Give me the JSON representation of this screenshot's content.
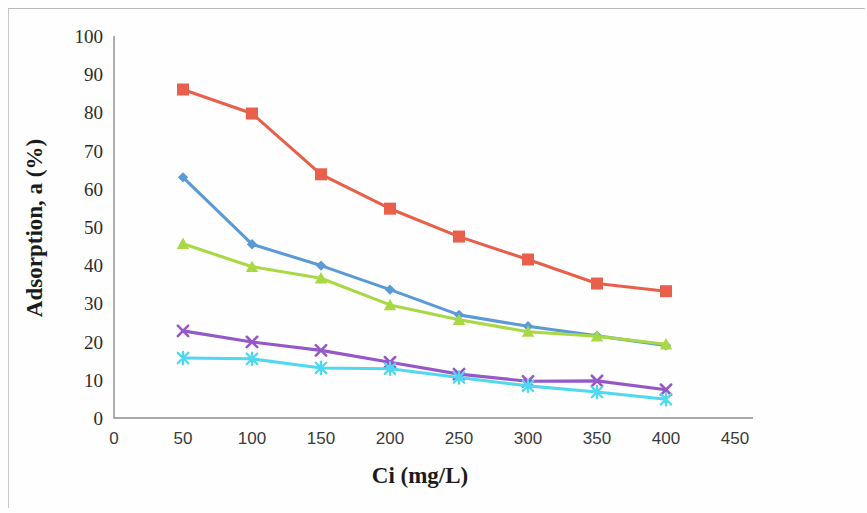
{
  "chart_data": {
    "type": "line",
    "title": "",
    "xlabel": "Ci   (mg/L)",
    "ylabel": "Adsorption, a (%)",
    "x": [
      50,
      100,
      150,
      200,
      250,
      300,
      350,
      400
    ],
    "xlim": [
      0,
      450
    ],
    "ylim": [
      0,
      100
    ],
    "xticks": [
      "0",
      "50",
      "100",
      "150",
      "200",
      "250",
      "300",
      "350",
      "400",
      "450"
    ],
    "yticks": [
      "0",
      "10",
      "20",
      "30",
      "40",
      "50",
      "60",
      "70",
      "80",
      "90",
      "100"
    ],
    "xtick_values": [
      0,
      50,
      100,
      150,
      200,
      250,
      300,
      350,
      400,
      450
    ],
    "ytick_values": [
      0,
      10,
      20,
      30,
      40,
      50,
      60,
      70,
      80,
      90,
      100
    ],
    "grid": false,
    "legend_position": "right",
    "series": [
      {
        "name": "Cu",
        "color": "#5b9bd5",
        "marker": "diamond",
        "values": [
          63.0,
          45.5,
          39.9,
          33.6,
          27.0,
          24.0,
          21.5,
          19.0
        ]
      },
      {
        "name": "Pb",
        "color": "#e8604c",
        "marker": "square",
        "values": [
          86.0,
          79.7,
          63.8,
          54.8,
          47.5,
          41.5,
          35.2,
          33.2
        ]
      },
      {
        "name": "Zn",
        "color": "#a9d845",
        "marker": "triangle",
        "values": [
          45.6,
          39.6,
          36.6,
          29.6,
          25.7,
          22.6,
          21.4,
          19.3
        ]
      },
      {
        "name": "Mn",
        "color": "#9657c8",
        "marker": "cross",
        "values": [
          22.8,
          19.9,
          17.7,
          14.6,
          11.5,
          9.6,
          9.7,
          7.4
        ]
      },
      {
        "name": "Cd",
        "color": "#4fd8ef",
        "marker": "star",
        "values": [
          15.7,
          15.5,
          13.1,
          12.9,
          10.6,
          8.4,
          6.8,
          4.9
        ]
      }
    ]
  },
  "axes": {
    "y_title": "Adsorption, a (%)",
    "x_title": "Ci   (mg/L)"
  },
  "legend": {
    "items": [
      {
        "label": "Cu"
      },
      {
        "label": "Pb"
      },
      {
        "label": "Zn"
      },
      {
        "label": "Mn"
      },
      {
        "label": "Cd"
      }
    ]
  }
}
